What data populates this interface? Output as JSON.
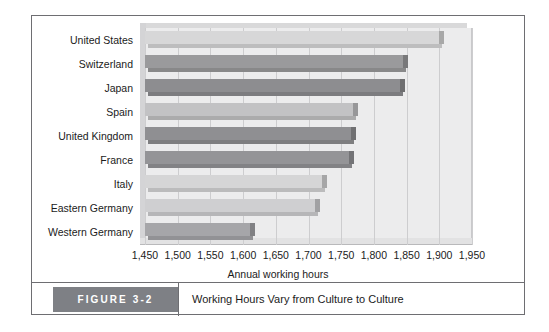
{
  "figure": {
    "tag_label": "FIGURE 3-2",
    "caption_title": "Working Hours Vary from Culture to Culture"
  },
  "chart_data": {
    "type": "bar",
    "orientation": "horizontal",
    "title": "",
    "xlabel": "Annual working hours",
    "ylabel": "",
    "xlim": [
      1450,
      1950
    ],
    "xtick_step": 50,
    "grid": true,
    "legend": "none",
    "categories": [
      "United States",
      "Switzerland",
      "Japan",
      "Spain",
      "United Kingdom",
      "France",
      "Italy",
      "Eastern Germany",
      "Western Germany"
    ],
    "values": [
      1900,
      1845,
      1840,
      1768,
      1765,
      1762,
      1720,
      1710,
      1610
    ],
    "xticks": [
      "1,450",
      "1,500",
      "1,550",
      "1,600",
      "1,650",
      "1,700",
      "1,750",
      "1,800",
      "1,850",
      "1,900",
      "1,950"
    ],
    "bar_colors": [
      "#d7d7d8",
      "#9a9a9c",
      "#8d8d90",
      "#c2c2c4",
      "#8f8f92",
      "#949497",
      "#d5d5d6",
      "#cfcfd1",
      "#a6a6a9"
    ],
    "colors": {
      "plot_background": "#ececed",
      "gridline": "#cdcdcf",
      "frame": "#6e6e72",
      "caption_tag_background": "#7e8085",
      "text": "#1b1b1b"
    }
  }
}
